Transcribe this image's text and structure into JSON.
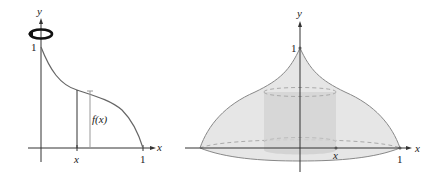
{
  "left_figure": {
    "axis_labels": {
      "x": "x",
      "y": "y"
    },
    "tick_labels": {
      "y_one": "1",
      "x_one": "1",
      "x_var": "x"
    },
    "function_label": "f(x)",
    "rotation_icon": "rotation-arrow-icon",
    "colors": {
      "curve": "#666666",
      "axis": "#333333",
      "bracket": "#999999"
    }
  },
  "right_figure": {
    "axis_labels": {
      "x": "x",
      "y": "y"
    },
    "tick_labels": {
      "y_one": "1",
      "x_one": "1",
      "x_var": "x"
    },
    "colors": {
      "solid_fill": "#e4e4e4",
      "shell_fill": "#d2d2d2",
      "outline": "#888888"
    }
  }
}
